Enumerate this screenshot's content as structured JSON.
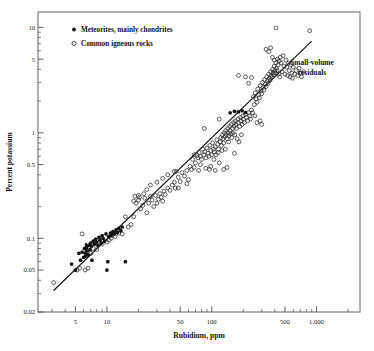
{
  "chart_data": {
    "type": "scatter",
    "title": "",
    "xlabel": "Rubidium, ppm",
    "ylabel": "Percent potassium",
    "xscale": "log",
    "yscale": "log",
    "xlim": [
      2.2,
      2600
    ],
    "ylim": [
      0.02,
      14
    ],
    "grid": false,
    "xticks_labeled": [
      {
        "value": 5,
        "label": "5"
      },
      {
        "value": 10,
        "label": "10"
      },
      {
        "value": 50,
        "label": "50"
      },
      {
        "value": 100,
        "label": "100"
      },
      {
        "value": 500,
        "label": "500"
      },
      {
        "value": 1000,
        "label": "1,000"
      }
    ],
    "yticks_labeled": [
      {
        "value": 10,
        "label": "10"
      },
      {
        "value": 5,
        "label": "5"
      },
      {
        "value": 1,
        "label": "1"
      },
      {
        "value": 0.5,
        "label": "0.5"
      },
      {
        "value": 0.1,
        "label": "0.1"
      },
      {
        "value": 0.05,
        "label": "0.05"
      },
      {
        "value": 0.02,
        "label": "0.02"
      }
    ],
    "legend": {
      "position": "top-left-inside",
      "entries": [
        {
          "label": "Meteorites, mainly chondrites",
          "marker": "filled-circle"
        },
        {
          "label": "Common igneous rocks",
          "marker": "open-circle"
        }
      ]
    },
    "annotations": [
      {
        "text": "Small-volume residuals",
        "x": 700,
        "y": 4.6
      }
    ],
    "trend_line": {
      "label": "K/Rb reference line",
      "x_start": 3.1,
      "y_start": 0.032,
      "x_end": 900,
      "y_end": 7.4
    },
    "series": [
      {
        "name": "Meteorites, mainly chondrites",
        "marker": "filled-circle",
        "points": [
          [
            4.6,
            0.057
          ],
          [
            5.0,
            0.05
          ],
          [
            5.4,
            0.072
          ],
          [
            5.6,
            0.062
          ],
          [
            5.8,
            0.074
          ],
          [
            6.0,
            0.066
          ],
          [
            6.1,
            0.08
          ],
          [
            6.2,
            0.072
          ],
          [
            6.3,
            0.068
          ],
          [
            6.4,
            0.082
          ],
          [
            6.5,
            0.076
          ],
          [
            6.6,
            0.07
          ],
          [
            6.7,
            0.086
          ],
          [
            6.9,
            0.078
          ],
          [
            7.0,
            0.09
          ],
          [
            7.1,
            0.084
          ],
          [
            7.2,
            0.062
          ],
          [
            7.4,
            0.094
          ],
          [
            7.6,
            0.088
          ],
          [
            7.8,
            0.098
          ],
          [
            8.0,
            0.092
          ],
          [
            8.2,
            0.086
          ],
          [
            8.4,
            0.102
          ],
          [
            8.6,
            0.096
          ],
          [
            8.8,
            0.09
          ],
          [
            9.0,
            0.106
          ],
          [
            9.2,
            0.1
          ],
          [
            9.5,
            0.094
          ],
          [
            9.8,
            0.11
          ],
          [
            10.0,
            0.05
          ],
          [
            10.2,
            0.06
          ],
          [
            10.4,
            0.104
          ],
          [
            10.8,
            0.112
          ],
          [
            11.0,
            0.106
          ],
          [
            11.4,
            0.116
          ],
          [
            11.8,
            0.11
          ],
          [
            12.2,
            0.12
          ],
          [
            12.6,
            0.114
          ],
          [
            13.0,
            0.124
          ],
          [
            13.6,
            0.118
          ],
          [
            14.0,
            0.128
          ],
          [
            15.0,
            0.06
          ],
          [
            150,
            1.55
          ],
          [
            165,
            1.6
          ],
          [
            180,
            1.58
          ],
          [
            195,
            1.62
          ],
          [
            210,
            1.56
          ]
        ]
      },
      {
        "name": "Common igneous rocks",
        "marker": "open-circle",
        "points": [
          [
            3.1,
            0.038
          ],
          [
            5.2,
            0.05
          ],
          [
            5.5,
            0.052
          ],
          [
            5.8,
            0.11
          ],
          [
            6.2,
            0.05
          ],
          [
            6.6,
            0.052
          ],
          [
            7.0,
            0.072
          ],
          [
            7.4,
            0.08
          ],
          [
            8.0,
            0.078
          ],
          [
            9.0,
            0.088
          ],
          [
            10.0,
            0.092
          ],
          [
            10.5,
            0.096
          ],
          [
            11.0,
            0.1
          ],
          [
            12.0,
            0.104
          ],
          [
            13.0,
            0.112
          ],
          [
            14.0,
            0.11
          ],
          [
            15.0,
            0.16
          ],
          [
            16.0,
            0.128
          ],
          [
            17.0,
            0.135
          ],
          [
            18.0,
            0.225
          ],
          [
            18.5,
            0.25
          ],
          [
            19.0,
            0.215
          ],
          [
            20.0,
            0.23
          ],
          [
            20.5,
            0.245
          ],
          [
            21.0,
            0.19
          ],
          [
            22.0,
            0.205
          ],
          [
            22.5,
            0.265
          ],
          [
            23.0,
            0.24
          ],
          [
            24.0,
            0.175
          ],
          [
            25.0,
            0.215
          ],
          [
            26.0,
            0.25
          ],
          [
            27.0,
            0.23
          ],
          [
            28.0,
            0.2
          ],
          [
            29.0,
            0.255
          ],
          [
            30.0,
            0.215
          ],
          [
            31.0,
            0.235
          ],
          [
            32.0,
            0.265
          ],
          [
            33.0,
            0.245
          ],
          [
            34.0,
            0.225
          ],
          [
            35.0,
            0.28
          ],
          [
            36.0,
            0.26
          ],
          [
            38.0,
            0.3
          ],
          [
            40.0,
            0.285
          ],
          [
            42.0,
            0.32
          ],
          [
            44.0,
            0.34
          ],
          [
            45.0,
            0.3
          ],
          [
            46.0,
            0.43
          ],
          [
            48.0,
            0.38
          ],
          [
            50.0,
            0.345
          ],
          [
            52.0,
            0.42
          ],
          [
            55.0,
            0.39
          ],
          [
            58.0,
            0.44
          ],
          [
            60.0,
            0.36
          ],
          [
            62.0,
            0.48
          ],
          [
            64.0,
            0.45
          ],
          [
            66.0,
            0.56
          ],
          [
            68.0,
            0.62
          ],
          [
            70.0,
            0.52
          ],
          [
            72.0,
            0.61
          ],
          [
            74.0,
            0.58
          ],
          [
            75.0,
            0.44
          ],
          [
            76.0,
            0.65
          ],
          [
            78.0,
            0.6
          ],
          [
            80.0,
            0.56
          ],
          [
            82.0,
            0.7
          ],
          [
            84.0,
            0.62
          ],
          [
            85.0,
            1.1
          ],
          [
            86.0,
            0.66
          ],
          [
            88.0,
            0.58
          ],
          [
            90.0,
            0.72
          ],
          [
            92.0,
            0.64
          ],
          [
            94.0,
            0.6
          ],
          [
            95.0,
            0.45
          ],
          [
            96.0,
            0.76
          ],
          [
            98.0,
            0.68
          ],
          [
            100.0,
            0.62
          ],
          [
            102.0,
            0.8
          ],
          [
            104.0,
            0.7
          ],
          [
            105.0,
            0.56
          ],
          [
            106.0,
            0.66
          ],
          [
            108.0,
            0.74
          ],
          [
            110.0,
            0.62
          ],
          [
            112.0,
            0.86
          ],
          [
            114.0,
            0.78
          ],
          [
            115.0,
            0.65
          ],
          [
            116.0,
            0.7
          ],
          [
            118.0,
            1.35
          ],
          [
            120.0,
            0.82
          ],
          [
            122.0,
            0.9
          ],
          [
            124.0,
            0.76
          ],
          [
            125.0,
            0.68
          ],
          [
            126.0,
            0.96
          ],
          [
            128.0,
            0.88
          ],
          [
            130.0,
            0.8
          ],
          [
            132.0,
            1.0
          ],
          [
            134.0,
            0.92
          ],
          [
            135.0,
            0.7
          ],
          [
            136.0,
            1.05
          ],
          [
            138.0,
            0.96
          ],
          [
            140.0,
            0.88
          ],
          [
            142.0,
            1.1
          ],
          [
            144.0,
            1.0
          ],
          [
            145.0,
            0.82
          ],
          [
            146.0,
            0.94
          ],
          [
            148.0,
            1.15
          ],
          [
            150.0,
            1.05
          ],
          [
            152.0,
            0.98
          ],
          [
            154.0,
            1.2
          ],
          [
            155.0,
            0.9
          ],
          [
            158.0,
            1.1
          ],
          [
            160.0,
            1.0
          ],
          [
            162.0,
            1.25
          ],
          [
            164.0,
            1.15
          ],
          [
            165.0,
            0.64
          ],
          [
            166.0,
            0.96
          ],
          [
            168.0,
            1.3
          ],
          [
            170.0,
            1.2
          ],
          [
            172.0,
            1.1
          ],
          [
            175.0,
            0.88
          ],
          [
            178.0,
            1.35
          ],
          [
            180.0,
            1.25
          ],
          [
            182.0,
            0.82
          ],
          [
            185.0,
            1.15
          ],
          [
            188.0,
            1.4
          ],
          [
            190.0,
            1.3
          ],
          [
            192.0,
            0.96
          ],
          [
            195.0,
            1.2
          ],
          [
            198.0,
            1.45
          ],
          [
            200.0,
            1.35
          ],
          [
            205.0,
            1.25
          ],
          [
            210.0,
            1.5
          ],
          [
            215.0,
            1.4
          ],
          [
            220.0,
            1.3
          ],
          [
            225.0,
            1.55
          ],
          [
            230.0,
            1.45
          ],
          [
            235.0,
            1.35
          ],
          [
            240.0,
            1.65
          ],
          [
            245.0,
            1.55
          ],
          [
            250.0,
            2.2
          ],
          [
            255.0,
            1.85
          ],
          [
            258.0,
            1.45
          ],
          [
            260.0,
            2.4
          ],
          [
            265.0,
            2.1
          ],
          [
            270.0,
            1.95
          ],
          [
            275.0,
            2.6
          ],
          [
            280.0,
            2.3
          ],
          [
            285.0,
            2.15
          ],
          [
            290.0,
            2.8
          ],
          [
            295.0,
            2.5
          ],
          [
            300.0,
            2.35
          ],
          [
            305.0,
            3.0
          ],
          [
            310.0,
            2.7
          ],
          [
            315.0,
            2.55
          ],
          [
            320.0,
            3.2
          ],
          [
            325.0,
            2.9
          ],
          [
            330.0,
            2.75
          ],
          [
            335.0,
            3.4
          ],
          [
            340.0,
            3.1
          ],
          [
            345.0,
            2.95
          ],
          [
            350.0,
            3.6
          ],
          [
            355.0,
            3.3
          ],
          [
            360.0,
            3.15
          ],
          [
            365.0,
            3.8
          ],
          [
            370.0,
            3.5
          ],
          [
            375.0,
            3.35
          ],
          [
            380.0,
            4.0
          ],
          [
            385.0,
            3.7
          ],
          [
            390.0,
            3.55
          ],
          [
            395.0,
            4.3
          ],
          [
            400.0,
            3.9
          ],
          [
            405.0,
            3.7
          ],
          [
            410.0,
            4.6
          ],
          [
            415.0,
            4.1
          ],
          [
            420.0,
            3.9
          ],
          [
            425.0,
            5.0
          ],
          [
            430.0,
            4.4
          ],
          [
            435.0,
            3.6
          ],
          [
            440.0,
            4.8
          ],
          [
            445.0,
            3.4
          ],
          [
            450.0,
            5.2
          ],
          [
            460.0,
            4.6
          ],
          [
            470.0,
            3.8
          ],
          [
            480.0,
            5.4
          ],
          [
            490.0,
            4.3
          ],
          [
            500.0,
            3.6
          ],
          [
            510.0,
            4.9
          ],
          [
            520.0,
            4.2
          ],
          [
            530.0,
            3.5
          ],
          [
            540.0,
            4.6
          ],
          [
            550.0,
            3.9
          ],
          [
            560.0,
            3.4
          ],
          [
            570.0,
            4.4
          ],
          [
            580.0,
            3.7
          ],
          [
            590.0,
            3.3
          ],
          [
            600.0,
            4.2
          ],
          [
            620.0,
            3.6
          ],
          [
            640.0,
            3.9
          ],
          [
            660.0,
            3.5
          ],
          [
            680.0,
            4.1
          ],
          [
            700.0,
            3.7
          ],
          [
            720.0,
            3.4
          ],
          [
            750.0,
            3.8
          ],
          [
            210.0,
            3.4
          ],
          [
            225.0,
            2.95
          ],
          [
            330.0,
            6.2
          ],
          [
            350.0,
            5.9
          ],
          [
            365.0,
            6.4
          ],
          [
            380.0,
            5.2
          ],
          [
            395.0,
            4.9
          ],
          [
            410.0,
            9.9
          ],
          [
            860.0,
            9.3
          ],
          [
            240.0,
            3.35
          ],
          [
            180.0,
            3.5
          ],
          [
            270.0,
            1.25
          ],
          [
            290.0,
            1.3
          ],
          [
            300.0,
            1.2
          ],
          [
            130.0,
            0.45
          ],
          [
            140.0,
            0.47
          ],
          [
            118.0,
            0.52
          ],
          [
            108.0,
            0.44
          ],
          [
            98.0,
            0.48
          ],
          [
            88.0,
            0.46
          ],
          [
            78.0,
            0.5
          ],
          [
            68.0,
            0.47
          ],
          [
            58.0,
            0.33
          ],
          [
            48.0,
            0.3
          ],
          [
            44.0,
            0.43
          ],
          [
            38.0,
            0.4
          ],
          [
            34.0,
            0.37
          ],
          [
            30.0,
            0.34
          ],
          [
            26.0,
            0.32
          ],
          [
            24.0,
            0.29
          ],
          [
            20.0,
            0.255
          ],
          [
            18.0,
            0.16
          ]
        ]
      }
    ]
  }
}
